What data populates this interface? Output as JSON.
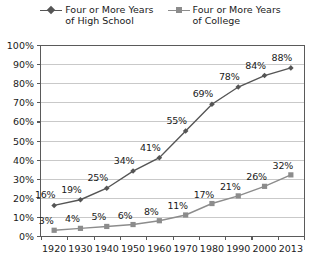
{
  "chart_data": {
    "type": "line",
    "title": "",
    "subtitle": "",
    "xlabel": "",
    "ylabel": "",
    "x": [
      "1920",
      "1930",
      "1940",
      "1950",
      "1960",
      "1970",
      "1980",
      "1990",
      "2000",
      "2013"
    ],
    "categories": [
      "1920",
      "1930",
      "1940",
      "1950",
      "1960",
      "1970",
      "1980",
      "1990",
      "2000",
      "2013"
    ],
    "series": [
      {
        "name": "Four or More Years of High School",
        "values": [
          16,
          19,
          25,
          34,
          41,
          55,
          69,
          78,
          84,
          88
        ],
        "labels": [
          "16%",
          "19%",
          "25%",
          "34%",
          "41%",
          "55%",
          "69%",
          "78%",
          "84%",
          "88%"
        ],
        "color": "#555555",
        "marker": "diamond"
      },
      {
        "name": "Four or More Years of College",
        "values": [
          3,
          4,
          5,
          6,
          8,
          11,
          17,
          21,
          26,
          32
        ],
        "labels": [
          "3%",
          "4%",
          "5%",
          "6%",
          "8%",
          "11%",
          "17%",
          "21%",
          "26%",
          "32%"
        ],
        "color": "#8c8c8c",
        "marker": "square"
      }
    ],
    "ylim": [
      0,
      100
    ],
    "yticks": [
      0,
      10,
      20,
      30,
      40,
      50,
      60,
      70,
      80,
      90,
      100
    ],
    "ytick_labels": [
      "0%",
      "10%",
      "20%",
      "30%",
      "40%",
      "50%",
      "60%",
      "70%",
      "80%",
      "90%",
      "100%"
    ],
    "grid": true,
    "legend_position": "top"
  },
  "legend": {
    "entries": [
      {
        "line1": "Four or More Years",
        "line2": "of High School",
        "marker": "diamond",
        "color": "#555555"
      },
      {
        "line1": "Four or More Years",
        "line2": "of College",
        "marker": "square",
        "color": "#8c8c8c"
      }
    ]
  }
}
